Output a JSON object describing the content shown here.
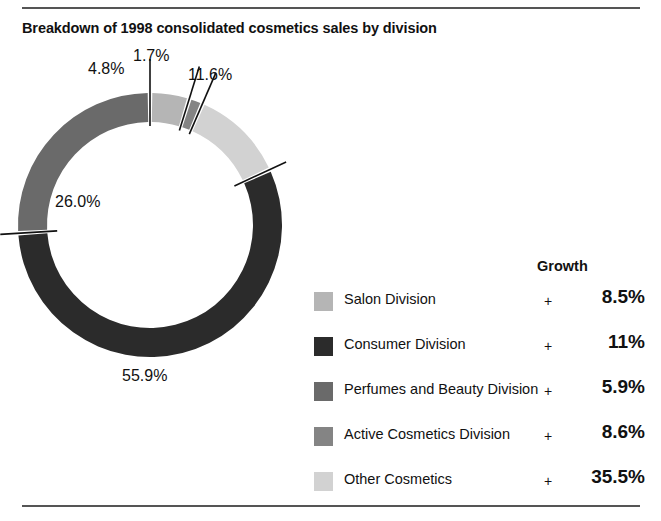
{
  "title": "Breakdown of 1998 consolidated cosmetics sales by division",
  "legend": {
    "growth_header": "Growth",
    "plus_sign": "+",
    "rows": [
      {
        "label": "Salon Division",
        "growth": "8.5%",
        "color": "#b5b5b5"
      },
      {
        "label": "Consumer Division",
        "growth": "11%",
        "color": "#2b2b2b"
      },
      {
        "label": "Perfumes and Beauty Division",
        "growth": "5.9%",
        "color": "#6a6a6a"
      },
      {
        "label": "Active Cosmetics Division",
        "growth": "8.6%",
        "color": "#848484"
      },
      {
        "label": "Other Cosmetics",
        "growth": "35.5%",
        "color": "#d2d2d2"
      }
    ]
  },
  "chart_data": {
    "type": "pie",
    "title": "Breakdown of 1998 consolidated cosmetics sales by division",
    "subtype": "donut",
    "units": "percent of consolidated cosmetics sales",
    "legend_position": "right",
    "grid": false,
    "categories": [
      "Salon Division",
      "Active Cosmetics Division",
      "Other Cosmetics",
      "Consumer Division",
      "Perfumes and Beauty Division"
    ],
    "values": [
      4.8,
      1.7,
      11.6,
      55.9,
      26.0
    ],
    "labels": [
      "4.8%",
      "1.7%",
      "11.6%",
      "55.9%",
      "26.0%"
    ],
    "colors": [
      "#b5b5b5",
      "#848484",
      "#d2d2d2",
      "#2b2b2b",
      "#6a6a6a"
    ],
    "growth": [
      "+ 8.5%",
      "+ 8.6%",
      "+ 35.5%",
      "+ 11%",
      "+ 5.9%"
    ],
    "start_angle_deg": 0,
    "direction": "clockwise",
    "inner_radius_ratio": 0.78
  }
}
